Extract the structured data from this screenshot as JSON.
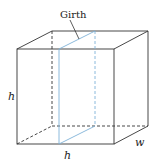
{
  "diagram": {
    "labels": {
      "girth": "Girth",
      "height": "h",
      "depth": "h",
      "width": "w"
    },
    "colors": {
      "edge": "#333333",
      "girth_plane": "#7fb2d8"
    }
  }
}
